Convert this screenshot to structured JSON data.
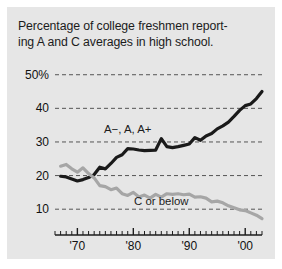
{
  "figure": {
    "background_color": "#e6e6e6",
    "page_background": "#ffffff",
    "title_line1": "Percentage of college freshmen report-",
    "title_line2": "ing A and C averages in high school."
  },
  "chart_data": {
    "type": "line",
    "xlabel": "",
    "ylabel": "",
    "xlim": [
      1966,
      2003
    ],
    "ylim": [
      5,
      52
    ],
    "grid": true,
    "grid_style": "dashed-horizontal",
    "legend_position": "inline-annotation",
    "ytick_labels": [
      "50%",
      "40",
      "30",
      "20",
      "10"
    ],
    "ytick_values": [
      50,
      40,
      30,
      20,
      10
    ],
    "xtick_labels": [
      "'70",
      "'80",
      "'90",
      "'00"
    ],
    "xtick_values": [
      1970,
      1980,
      1990,
      2000
    ],
    "minor_ticks": "yearly",
    "annotations": [
      {
        "text": "A−, A, A+",
        "x": 1979,
        "y": 34,
        "color": "#1c1c1c"
      },
      {
        "text": "C or below",
        "x": 1985,
        "y": 12.5,
        "color": "#1c1c1c"
      }
    ],
    "series": [
      {
        "name": "A−, A, A+",
        "color": "#1a1a1a",
        "linewidth": 3.2,
        "x": [
          1967,
          1968,
          1969,
          1970,
          1971,
          1972,
          1973,
          1974,
          1975,
          1976,
          1977,
          1978,
          1979,
          1980,
          1981,
          1982,
          1983,
          1984,
          1985,
          1986,
          1987,
          1988,
          1989,
          1990,
          1991,
          1992,
          1993,
          1994,
          1995,
          1996,
          1997,
          1998,
          1999,
          2000,
          2001,
          2002,
          2003
        ],
        "values": [
          19.8,
          19.6,
          19.0,
          18.4,
          18.8,
          19.4,
          20.3,
          22.5,
          22.0,
          23.6,
          25.4,
          26.2,
          28.0,
          27.9,
          27.6,
          27.4,
          27.5,
          27.6,
          31.0,
          28.6,
          28.3,
          28.6,
          29.0,
          29.4,
          31.3,
          30.5,
          31.8,
          32.5,
          33.9,
          34.8,
          35.9,
          37.6,
          39.4,
          40.8,
          41.3,
          42.9,
          45.0
        ]
      },
      {
        "name": "C or below",
        "color": "#a6a6a6",
        "linewidth": 3.2,
        "x": [
          1967,
          1968,
          1969,
          1970,
          1971,
          1972,
          1973,
          1974,
          1975,
          1976,
          1977,
          1978,
          1979,
          1980,
          1981,
          1982,
          1983,
          1984,
          1985,
          1986,
          1987,
          1988,
          1989,
          1990,
          1991,
          1992,
          1993,
          1994,
          1995,
          1996,
          1997,
          1998,
          1999,
          2000,
          2001,
          2002,
          2003
        ],
        "values": [
          22.8,
          23.3,
          22.0,
          21.0,
          22.3,
          20.6,
          19.3,
          17.0,
          16.7,
          15.8,
          16.3,
          14.6,
          14.1,
          15.0,
          13.6,
          14.2,
          13.3,
          14.4,
          13.6,
          14.6,
          14.4,
          14.6,
          14.3,
          14.5,
          13.6,
          13.7,
          13.3,
          12.2,
          12.4,
          11.9,
          11.0,
          10.4,
          9.8,
          9.6,
          8.9,
          8.2,
          7.2
        ]
      }
    ]
  }
}
